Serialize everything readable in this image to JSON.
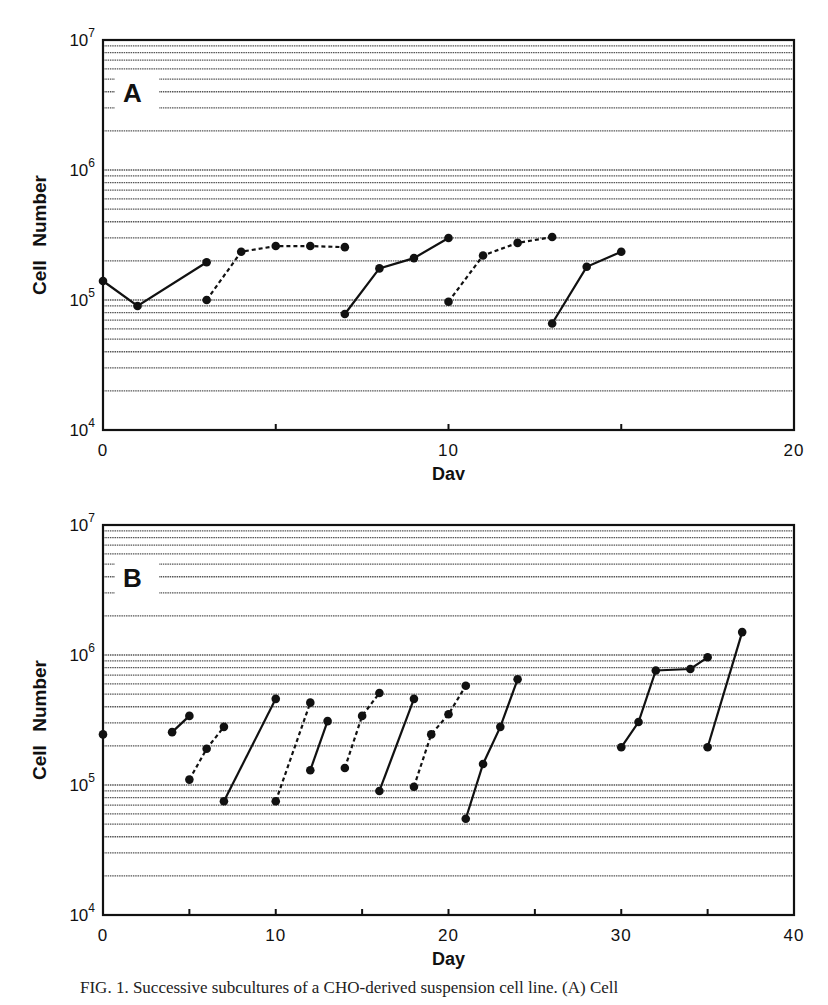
{
  "chart_data": [
    {
      "type": "line",
      "panel_label": "A",
      "title": "",
      "xlabel": "Day",
      "ylabel": "Cell Number",
      "xlim": [
        0,
        20
      ],
      "ylim": [
        10000,
        10000000
      ],
      "yscale": "log",
      "x_ticks": [
        0,
        10,
        20
      ],
      "y_ticks": [
        "10^4",
        "10^5",
        "10^6",
        "10^7"
      ],
      "grid": "horizontal log minor gridlines",
      "legend": "none",
      "series": [
        {
          "name": "culture 1",
          "style": "solid",
          "x": [
            0,
            1,
            3
          ],
          "y": [
            140000,
            90000,
            195000
          ]
        },
        {
          "name": "culture 2",
          "style": "dashed",
          "x": [
            3,
            4,
            5,
            6,
            7
          ],
          "y": [
            100000,
            235000,
            260000,
            260000,
            255000
          ]
        },
        {
          "name": "culture 3",
          "style": "solid",
          "x": [
            7,
            8,
            9,
            10
          ],
          "y": [
            78000,
            175000,
            210000,
            300000
          ]
        },
        {
          "name": "culture 4",
          "style": "dashed",
          "x": [
            10,
            11,
            12,
            13
          ],
          "y": [
            97000,
            220000,
            275000,
            305000
          ]
        },
        {
          "name": "culture 5",
          "style": "solid",
          "x": [
            13,
            14,
            15
          ],
          "y": [
            66000,
            180000,
            235000
          ]
        }
      ]
    },
    {
      "type": "line",
      "panel_label": "B",
      "title": "",
      "xlabel": "Day",
      "ylabel": "Cell Number",
      "xlim": [
        0,
        40
      ],
      "ylim": [
        10000,
        10000000
      ],
      "yscale": "log",
      "x_ticks": [
        0,
        10,
        20,
        30,
        40
      ],
      "y_ticks": [
        "10^4",
        "10^5",
        "10^6",
        "10^7"
      ],
      "grid": "horizontal log minor gridlines",
      "legend": "none",
      "series": [
        {
          "name": "s1",
          "style": "solid",
          "x": [
            0
          ],
          "y": [
            245000
          ]
        },
        {
          "name": "s2",
          "style": "solid",
          "x": [
            4,
            5
          ],
          "y": [
            255000,
            340000
          ]
        },
        {
          "name": "s3",
          "style": "dashed",
          "x": [
            5,
            6,
            7
          ],
          "y": [
            110000,
            190000,
            280000
          ]
        },
        {
          "name": "s4",
          "style": "solid",
          "x": [
            7,
            10
          ],
          "y": [
            75000,
            460000
          ]
        },
        {
          "name": "s5",
          "style": "dashed",
          "x": [
            10,
            12
          ],
          "y": [
            75000,
            430000
          ]
        },
        {
          "name": "s6",
          "style": "solid",
          "x": [
            12,
            13
          ],
          "y": [
            130000,
            310000
          ]
        },
        {
          "name": "s7",
          "style": "dashed",
          "x": [
            14,
            15,
            16
          ],
          "y": [
            135000,
            340000,
            510000
          ]
        },
        {
          "name": "s8",
          "style": "solid",
          "x": [
            16,
            18
          ],
          "y": [
            90000,
            460000
          ]
        },
        {
          "name": "s9",
          "style": "dashed",
          "x": [
            18,
            19,
            20,
            21
          ],
          "y": [
            97000,
            245000,
            350000,
            580000
          ]
        },
        {
          "name": "s10",
          "style": "solid",
          "x": [
            21,
            22,
            23,
            24
          ],
          "y": [
            55000,
            145000,
            280000,
            650000
          ]
        },
        {
          "name": "s11",
          "style": "solid",
          "x": [
            30,
            31,
            32,
            34,
            35
          ],
          "y": [
            195000,
            305000,
            760000,
            780000,
            960000
          ]
        },
        {
          "name": "s12",
          "style": "solid",
          "x": [
            35,
            37
          ],
          "y": [
            195000,
            1500000
          ]
        }
      ]
    }
  ],
  "panels": [
    {
      "label": "A",
      "xlabel": "Day",
      "ylabel": "Cell Number",
      "x_tick_labels": [
        "0",
        "10",
        "20"
      ],
      "y_tick_labels": [
        {
          "base": "10",
          "exp": "7"
        },
        {
          "base": "10",
          "exp": "6"
        },
        {
          "base": "10",
          "exp": "5"
        },
        {
          "base": "10",
          "exp": "4"
        }
      ]
    },
    {
      "label": "B",
      "xlabel": "Day",
      "ylabel": "Cell Number",
      "x_tick_labels": [
        "0",
        "10",
        "20",
        "30",
        "40"
      ],
      "y_tick_labels": [
        {
          "base": "10",
          "exp": "7"
        },
        {
          "base": "10",
          "exp": "6"
        },
        {
          "base": "10",
          "exp": "5"
        },
        {
          "base": "10",
          "exp": "4"
        }
      ]
    }
  ],
  "caption": "FIG. 1. Successive subcultures of a CHO-derived suspension cell line. (A) Cell"
}
